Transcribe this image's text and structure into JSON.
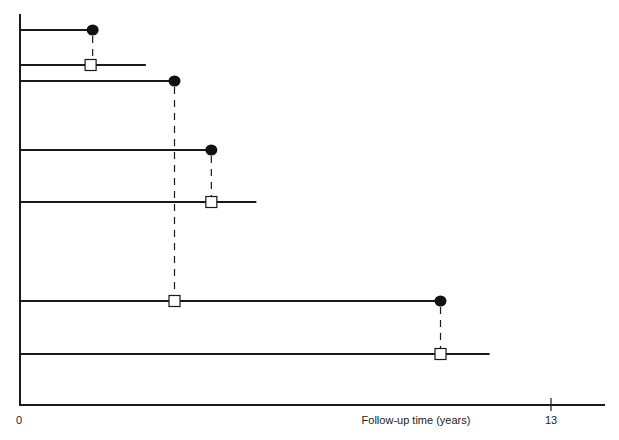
{
  "chart_data": {
    "type": "timeline",
    "title": "",
    "xlabel": "Follow-up time (years)",
    "ylabel": "",
    "xlim": [
      0,
      14.3
    ],
    "x_ticks": [
      {
        "value": 0,
        "label": "0"
      },
      {
        "value": 13,
        "label": "13"
      }
    ],
    "grid": false,
    "legend": null,
    "marker_legend": {
      "filled_circle": "event",
      "open_square": "matched / comparison time point"
    },
    "rows": [
      {
        "y": 30,
        "line_start": 0,
        "line_end": 1.8,
        "markers": [
          {
            "x": 1.8,
            "type": "filled-circle"
          }
        ]
      },
      {
        "y": 65,
        "line_start": 0,
        "line_end": 3.1,
        "markers": [
          {
            "x": 1.75,
            "type": "open-square"
          }
        ]
      },
      {
        "y": 81,
        "line_start": 0,
        "line_end": 3.8,
        "markers": [
          {
            "x": 3.8,
            "type": "filled-circle"
          }
        ]
      },
      {
        "y": 150,
        "line_start": 0,
        "line_end": 4.7,
        "markers": [
          {
            "x": 4.7,
            "type": "filled-circle"
          }
        ]
      },
      {
        "y": 202,
        "line_start": 0,
        "line_end": 5.8,
        "markers": [
          {
            "x": 4.7,
            "type": "open-square"
          }
        ]
      },
      {
        "y": 301,
        "line_start": 0,
        "line_end": 10.3,
        "markers": [
          {
            "x": 3.8,
            "type": "open-square"
          },
          {
            "x": 10.3,
            "type": "filled-circle"
          }
        ]
      },
      {
        "y": 354,
        "line_start": 0,
        "line_end": 11.5,
        "markers": [
          {
            "x": 10.3,
            "type": "open-square"
          }
        ]
      }
    ],
    "dashed_links": [
      {
        "x": 1.8,
        "from_row": 0,
        "to_row": 1
      },
      {
        "x": 3.8,
        "from_row": 2,
        "to_row": 5
      },
      {
        "x": 4.7,
        "from_row": 3,
        "to_row": 4
      },
      {
        "x": 10.3,
        "from_row": 5,
        "to_row": 6
      }
    ]
  },
  "axis": {
    "origin_label": "0",
    "end_label": "13",
    "title": "Follow-up time (years)"
  },
  "colors": {
    "line": "#1a1a1a",
    "marker_fill": "#111111",
    "square_fill": "#ffffff"
  }
}
